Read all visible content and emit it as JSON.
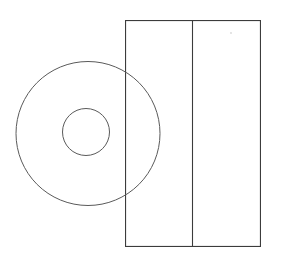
{
  "canvas": {
    "width": 284,
    "height": 260,
    "background_color": "#ffffff",
    "title": "Geometric line drawing: annulus overlapping divided rectangle"
  },
  "style": {
    "rect_stroke_color": "#3c3c3c",
    "rect_stroke_width": 1.1,
    "circle_stroke_color": "#5a5a5a",
    "circle_stroke_width": 1.0,
    "divider_stroke_color": "#3c3c3c",
    "divider_stroke_width": 1.1,
    "dot_color": "#d8d8d8",
    "faint_text_color": "#fcfcfd",
    "fill": "none"
  },
  "shapes": {
    "outer_circle": {
      "label": "outer-circle",
      "cx": 88,
      "cy": 133.5,
      "r": 72,
      "bbox": [
        16,
        61,
        160,
        206
      ]
    },
    "inner_circle": {
      "label": "inner-circle",
      "cx": 86,
      "cy": 132,
      "r": 23.5,
      "bbox": [
        62,
        108,
        110,
        156
      ]
    },
    "rectangle": {
      "label": "outer-rectangle",
      "x": 125,
      "y": 20,
      "width": 136,
      "height": 227,
      "bbox": [
        125,
        20,
        261,
        247
      ]
    },
    "divider_line": {
      "label": "vertical-divider",
      "x": 192.5,
      "y1": 20,
      "y2": 247
    },
    "dot_mark": {
      "label": "faint-dot-mark",
      "cx": 231,
      "cy": 33,
      "r": 0.9
    }
  },
  "annotations": {
    "faint_header_text": "           "
  }
}
